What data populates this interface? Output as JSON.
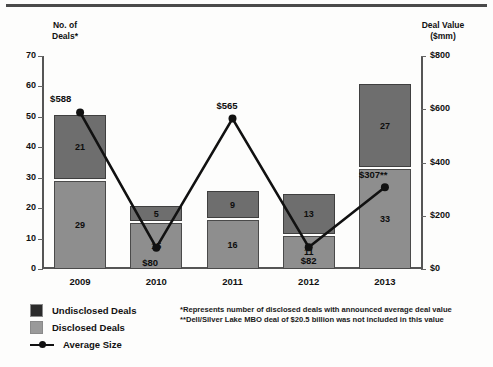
{
  "chart_data": {
    "type": "bar",
    "title": "",
    "categories": [
      "2009",
      "2010",
      "2011",
      "2012",
      "2013"
    ],
    "series": [
      {
        "name": "Undisclosed Deals",
        "values": [
          21,
          5,
          9,
          13,
          27
        ],
        "color": "#6e6e6e"
      },
      {
        "name": "Disclosed Deals",
        "values": [
          29,
          15,
          16,
          11,
          33
        ],
        "color": "#8e8e8e"
      },
      {
        "name": "Average Size",
        "values": [
          588,
          80,
          565,
          82,
          307
        ],
        "color": "#111111",
        "axis": "right"
      }
    ],
    "totals": [
      50,
      20,
      25,
      24,
      60
    ],
    "average_size_labels": [
      "$588",
      "$80",
      "$565",
      "$82",
      "$307**"
    ],
    "xlabel": "",
    "ylabel": "No. of Deals*",
    "y2label": "Deal Value ($mm)",
    "ylim": [
      0,
      70
    ],
    "y2lim": [
      0,
      800
    ],
    "grid": false,
    "legend_position": "bottom-left"
  },
  "axes": {
    "left_caption_line1": "No. of",
    "left_caption_line2": "Deals*",
    "right_caption_line1": "Deal Value",
    "right_caption_line2": "($mm)",
    "left_ticks": [
      "70",
      "60",
      "50",
      "40",
      "30",
      "20",
      "10",
      "0"
    ],
    "right_ticks": [
      "$800",
      "$600",
      "$400",
      "$200",
      "$0"
    ]
  },
  "bars": [
    {
      "year": "2009",
      "undisclosed": "21",
      "disclosed": "29",
      "avg_label": "$588"
    },
    {
      "year": "2010",
      "undisclosed": "5",
      "disclosed": "15",
      "avg_label": "$80"
    },
    {
      "year": "2011",
      "undisclosed": "9",
      "disclosed": "16",
      "avg_label": "$565"
    },
    {
      "year": "2012",
      "undisclosed": "13",
      "disclosed": "11",
      "avg_label": "$82"
    },
    {
      "year": "2013",
      "undisclosed": "27",
      "disclosed": "33",
      "avg_label": "$307**"
    }
  ],
  "legend": {
    "undisclosed": "Undisclosed Deals",
    "disclosed": "Disclosed Deals",
    "average": "Average Size"
  },
  "footnotes": {
    "note1": "*Represents number of disclosed deals with announced average deal value",
    "note2": "**Dell/Silver Lake MBO deal of $20.5 billion was not included in this value"
  }
}
